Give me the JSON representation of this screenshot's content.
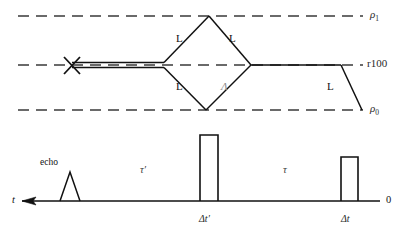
{
  "figure": {
    "type": "physics-schematic",
    "colors": {
      "line": "#111111",
      "dashed": "#3a3a3a",
      "faint": "#8a8a8a",
      "background": "#ffffff"
    }
  },
  "top_panel": {
    "reference_lines": [
      {
        "id": "rho1",
        "label": "ρ",
        "sub": "1",
        "y": 16
      },
      {
        "id": "r100",
        "label": "r100",
        "sub": "",
        "y": 65
      },
      {
        "id": "rho0",
        "label": "ρ",
        "sub": "0",
        "y": 110
      }
    ],
    "segment_labels": [
      {
        "id": "L-upper-left",
        "text": "L",
        "x": 176,
        "y": 38
      },
      {
        "id": "L-upper-right",
        "text": "L",
        "x": 229,
        "y": 38
      },
      {
        "id": "L-lower-left",
        "text": "L",
        "x": 176,
        "y": 86
      },
      {
        "id": "L-right",
        "text": "L",
        "x": 327,
        "y": 86
      },
      {
        "id": "lambda",
        "text": "Λ",
        "x": 221,
        "y": 86
      }
    ],
    "marker": {
      "id": "cross-marker",
      "symbol": "X",
      "x": 72,
      "y": 65
    }
  },
  "bottom_panel": {
    "axis": {
      "label": "t",
      "label_x": 12,
      "label_y": 202,
      "y": 201,
      "x_start": 22,
      "x_end": 380,
      "arrow_direction": "left",
      "origin_label": "0",
      "origin_x": 386
    },
    "echo": {
      "label": "echo",
      "label_x": 40,
      "label_y": 163,
      "peak_x": 70,
      "peak_top": 172,
      "half_width": 10
    },
    "intervals": [
      {
        "id": "tau-prime",
        "text": "τ′",
        "x": 140,
        "y": 170
      },
      {
        "id": "tau",
        "text": "τ",
        "x": 283,
        "y": 170
      }
    ],
    "pulses": [
      {
        "id": "pulse-delta-t-prime",
        "tick_label": "Δt′",
        "label_x": 204,
        "label_y": 220,
        "x": 200,
        "width": 18,
        "top": 135
      },
      {
        "id": "pulse-delta-t",
        "tick_label": "Δt",
        "label_x": 345,
        "label_y": 220,
        "x": 341,
        "width": 17,
        "top": 157
      }
    ]
  }
}
